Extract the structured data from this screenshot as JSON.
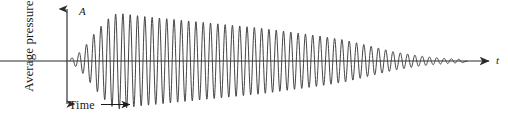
{
  "figure": {
    "type": "damped-oscillation-waveform",
    "labels": {
      "amplitude_axis": "A",
      "time_axis": "t",
      "vertical_axis_title": "Average pressure",
      "horizontal_axis_title": "Time"
    },
    "colors": {
      "curve": "#3a3a3a",
      "axis": "#2b2b2b",
      "text": "#1a1a1a",
      "background": "#ffffff"
    }
  },
  "chart_data": {
    "type": "line",
    "title": "",
    "xlabel": "Time",
    "ylabel": "Average pressure",
    "annotations": [
      "A",
      "t"
    ],
    "grid": false,
    "legend": null,
    "axis": {
      "baseline_y": 61,
      "vertical_axis_x": 67,
      "vertical_axis_top": 5,
      "vertical_axis_bottom": 108,
      "horizontal_axis_start": 0,
      "horizontal_axis_end": 492,
      "arrowheads": [
        "vertical-up",
        "vertical-down",
        "horizontal-right"
      ]
    },
    "waveform": {
      "description": "Sound pressure of a plucked/struck note: rapid attack then long exponential decay",
      "start_x": 70,
      "end_x": 463,
      "period_px": 7.3,
      "peak_x": 118,
      "peak_amplitude_px": 48,
      "attack": {
        "from_x": 70,
        "to_x": 118,
        "from_amp": 2,
        "to_amp": 48
      },
      "decay": {
        "from_x": 118,
        "to_x": 463,
        "from_amp": 48,
        "to_amp": 1.5
      },
      "envelope_samples": [
        {
          "x": 70,
          "amp": 2
        },
        {
          "x": 78,
          "amp": 7
        },
        {
          "x": 86,
          "amp": 16
        },
        {
          "x": 94,
          "amp": 27
        },
        {
          "x": 103,
          "amp": 37
        },
        {
          "x": 111,
          "amp": 45
        },
        {
          "x": 118,
          "amp": 48
        },
        {
          "x": 140,
          "amp": 45
        },
        {
          "x": 170,
          "amp": 42
        },
        {
          "x": 200,
          "amp": 39
        },
        {
          "x": 230,
          "amp": 36
        },
        {
          "x": 260,
          "amp": 33
        },
        {
          "x": 290,
          "amp": 29
        },
        {
          "x": 320,
          "amp": 25
        },
        {
          "x": 345,
          "amp": 21
        },
        {
          "x": 370,
          "amp": 15
        },
        {
          "x": 395,
          "amp": 9
        },
        {
          "x": 420,
          "amp": 5
        },
        {
          "x": 440,
          "amp": 3
        },
        {
          "x": 463,
          "amp": 1.5
        }
      ]
    },
    "time_arrow": {
      "x_start": 102,
      "x_end": 136,
      "y": 104
    },
    "ylim": [
      -48,
      48
    ],
    "xlim": [
      0,
      508
    ]
  }
}
